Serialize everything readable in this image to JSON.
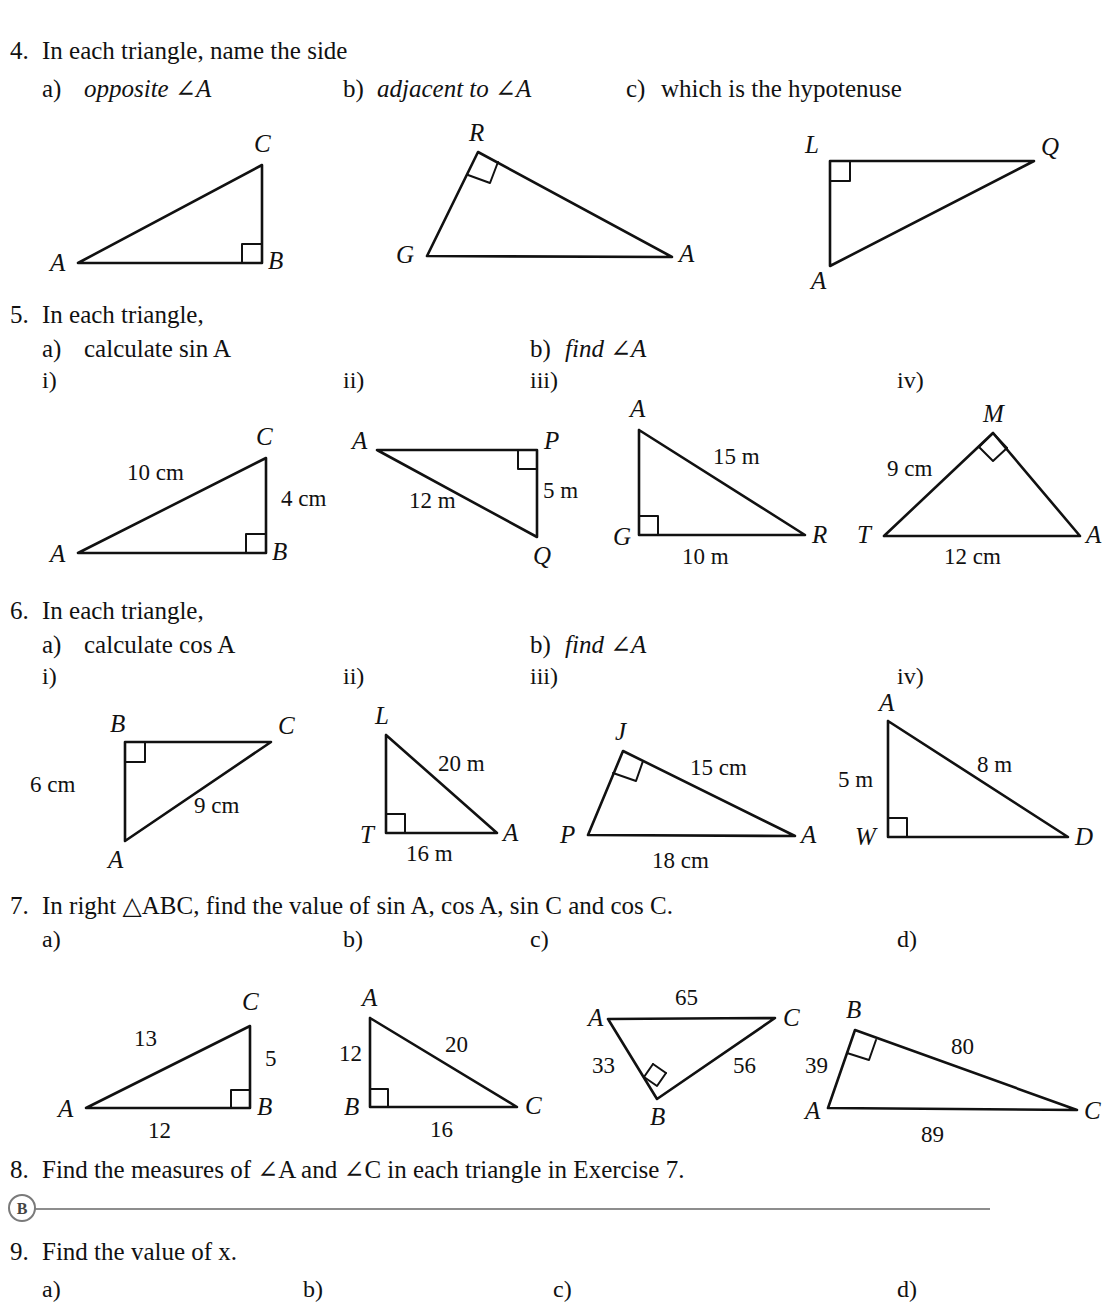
{
  "page": {
    "section_badge": "B"
  },
  "exercises": [
    {
      "number": "4.",
      "stem": "In each triangle, name the side",
      "parts": [
        {
          "label": "a)",
          "text": "opposite ∠A"
        },
        {
          "label": "b)",
          "text": "adjacent to ∠A"
        },
        {
          "label": "c)",
          "text": "which is the hypotenuse"
        }
      ]
    },
    {
      "number": "5.",
      "stem": "In each triangle,",
      "parts": [
        {
          "label": "a)",
          "text": "calculate sin A"
        },
        {
          "label": "b)",
          "text": "find ∠A"
        }
      ],
      "romans": [
        "i)",
        "ii)",
        "iii)",
        "iv)"
      ]
    },
    {
      "number": "6.",
      "stem": "In each triangle,",
      "parts": [
        {
          "label": "a)",
          "text": "calculate cos A"
        },
        {
          "label": "b)",
          "text": "find ∠A"
        }
      ],
      "romans": [
        "i)",
        "ii)",
        "iii)",
        "iv)"
      ]
    },
    {
      "number": "7.",
      "stem": "In right △ABC, find the value of sin A, cos A, sin C and cos C.",
      "romans": [
        "a)",
        "b)",
        "c)",
        "d)"
      ]
    },
    {
      "number": "8.",
      "stem": "Find the measures of ∠A and ∠C in each triangle in Exercise 7."
    },
    {
      "number": "9.",
      "stem": "Find the value of x.",
      "romans": [
        "a)",
        "b)",
        "c)",
        "d)"
      ]
    }
  ],
  "figures": {
    "q4": [
      {
        "id": "q4a",
        "vertices": [
          "A",
          "B",
          "C"
        ],
        "measures": []
      },
      {
        "id": "q4b",
        "vertices": [
          "R",
          "G",
          "A"
        ],
        "measures": []
      },
      {
        "id": "q4c",
        "vertices": [
          "L",
          "Q",
          "A"
        ],
        "measures": []
      }
    ],
    "q5": [
      {
        "id": "q5i",
        "vertices": [
          "C",
          "A",
          "B"
        ],
        "measures": [
          "10 cm",
          "4 cm"
        ]
      },
      {
        "id": "q5ii",
        "vertices": [
          "A",
          "P",
          "Q"
        ],
        "measures": [
          "12 m",
          "5 m"
        ]
      },
      {
        "id": "q5iii",
        "vertices": [
          "A",
          "G",
          "R"
        ],
        "measures": [
          "15 m",
          "10 m"
        ]
      },
      {
        "id": "q5iv",
        "vertices": [
          "M",
          "T",
          "A"
        ],
        "measures": [
          "9 cm",
          "12 cm"
        ]
      }
    ],
    "q6": [
      {
        "id": "q6i",
        "vertices": [
          "B",
          "C",
          "A"
        ],
        "measures": [
          "6 cm",
          "9 cm"
        ]
      },
      {
        "id": "q6ii",
        "vertices": [
          "L",
          "T",
          "A"
        ],
        "measures": [
          "20 m",
          "16 m"
        ]
      },
      {
        "id": "q6iii",
        "vertices": [
          "J",
          "P",
          "A"
        ],
        "measures": [
          "15 cm",
          "18 cm"
        ]
      },
      {
        "id": "q6iv",
        "vertices": [
          "A",
          "W",
          "D"
        ],
        "measures": [
          "5 m",
          "8 m"
        ]
      }
    ],
    "q7": [
      {
        "id": "q7a",
        "vertices": [
          "C",
          "A",
          "B"
        ],
        "measures": [
          "13",
          "5",
          "12"
        ]
      },
      {
        "id": "q7b",
        "vertices": [
          "A",
          "B",
          "C"
        ],
        "measures": [
          "12",
          "20",
          "16"
        ]
      },
      {
        "id": "q7c",
        "vertices": [
          "A",
          "C",
          "B"
        ],
        "measures": [
          "65",
          "33",
          "56"
        ]
      },
      {
        "id": "q7d",
        "vertices": [
          "B",
          "A",
          "C"
        ],
        "measures": [
          "39",
          "80",
          "89"
        ]
      }
    ]
  }
}
